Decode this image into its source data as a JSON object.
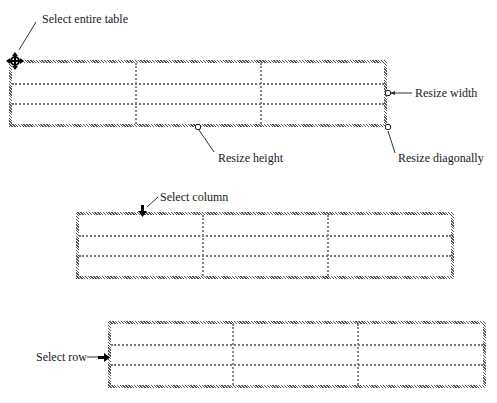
{
  "labels": {
    "select_entire_table": "Select entire table",
    "resize_width": "Resize width",
    "resize_height": "Resize height",
    "resize_diagonally": "Resize diagonally",
    "select_column": "Select column",
    "select_row": "Select row"
  },
  "tables": [
    {
      "name": "table-1",
      "rows": 3,
      "cols": 3
    },
    {
      "name": "table-2",
      "rows": 3,
      "cols": 3
    },
    {
      "name": "table-3",
      "rows": 3,
      "cols": 3
    }
  ],
  "icons": {
    "move_handle": "four-way-arrow",
    "resize_width_handle": "square-handle",
    "resize_height_handle": "square-handle",
    "resize_diagonal_handle": "square-handle",
    "select_column_arrow": "down-arrow",
    "select_row_arrow": "right-arrow"
  }
}
